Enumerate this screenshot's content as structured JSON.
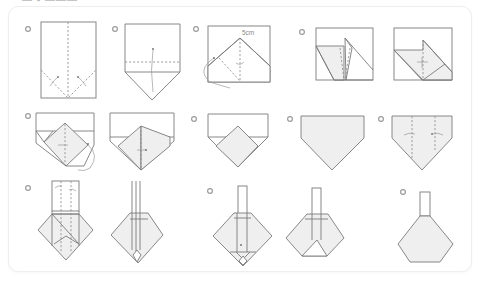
{
  "title": "— ▪ ———",
  "steps": [
    {
      "number": "1",
      "label": "step-1"
    },
    {
      "number": "2",
      "label": "step-2"
    },
    {
      "number": "3",
      "label": "step-3",
      "annotation": "5cm"
    },
    {
      "number": "4",
      "label": "step-4"
    },
    {
      "number": "5",
      "label": "step-5"
    },
    {
      "number": "6",
      "label": "step-6"
    },
    {
      "number": "7",
      "label": "step-7"
    },
    {
      "number": "8",
      "label": "step-8"
    },
    {
      "number": "9",
      "label": "step-9"
    },
    {
      "number": "10",
      "label": "step-10"
    },
    {
      "number": "11",
      "label": "step-11"
    }
  ],
  "colors": {
    "line": "#7a7a7a",
    "paper_fill": "#efefef",
    "background": "#ffffff",
    "card_border": "#eeeeee"
  }
}
